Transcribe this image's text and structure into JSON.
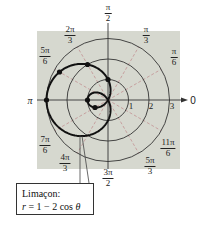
{
  "chart_data": {
    "type": "line",
    "subtype": "polar",
    "title": "",
    "equation": "r = 1 - 2 cos θ",
    "curve_name": "Limaçon",
    "callout": {
      "line1": "Limaçon:",
      "line2_prefix": "r",
      "line2_rest": " = 1 − 2 cos ",
      "line2_theta": "θ"
    },
    "radial_ticks": [
      1,
      2,
      3
    ],
    "rlim": [
      0,
      3
    ],
    "grid": true,
    "angle_labels": [
      {
        "num": "π",
        "den": "2",
        "angle_deg": 90
      },
      {
        "num": "π",
        "den": "3",
        "angle_deg": 60
      },
      {
        "num": "π",
        "den": "6",
        "angle_deg": 30
      },
      {
        "num": "0",
        "den": "",
        "angle_deg": 0
      },
      {
        "num": "11π",
        "den": "6",
        "angle_deg": 330
      },
      {
        "num": "5π",
        "den": "3",
        "angle_deg": 300
      },
      {
        "num": "3π",
        "den": "2",
        "angle_deg": 270
      },
      {
        "num": "4π",
        "den": "3",
        "angle_deg": 240
      },
      {
        "num": "7π",
        "den": "6",
        "angle_deg": 210
      },
      {
        "num": "π",
        "den": "",
        "angle_deg": 180
      },
      {
        "num": "5π",
        "den": "6",
        "angle_deg": 150
      },
      {
        "num": "2π",
        "den": "3",
        "angle_deg": 120
      }
    ],
    "marked_points": [
      {
        "theta": "0",
        "r": -1
      },
      {
        "theta": "π/6",
        "r": -0.73
      },
      {
        "theta": "π/2",
        "r": 1
      },
      {
        "theta": "2π/3",
        "r": 2
      },
      {
        "theta": "5π/6",
        "r": 2.73
      },
      {
        "theta": "π",
        "r": 3
      }
    ],
    "colors": {
      "background": "#d6d8cf",
      "curve": "#111111",
      "circles": "#333333",
      "spokes": "#c49a9a",
      "axes": "#333333"
    }
  }
}
